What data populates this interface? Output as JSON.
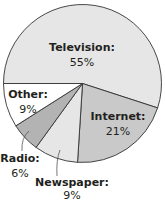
{
  "chart_data": {
    "type": "pie",
    "title": "",
    "slices": [
      {
        "label": "Television:",
        "pct_text": "55%",
        "value": 55,
        "color": "#e6e6e6"
      },
      {
        "label": "Internet:",
        "pct_text": "21%",
        "value": 21,
        "color": "#c9c9c9"
      },
      {
        "label": "Newspaper:",
        "pct_text": "9%",
        "value": 9,
        "color": "#e6e6e6"
      },
      {
        "label": "Radio:",
        "pct_text": "6%",
        "value": 6,
        "color": "#b3b3b3"
      },
      {
        "label": "Other:",
        "pct_text": "9%",
        "value": 9,
        "color": "#ffffff"
      }
    ],
    "start": "left, clockwise"
  }
}
